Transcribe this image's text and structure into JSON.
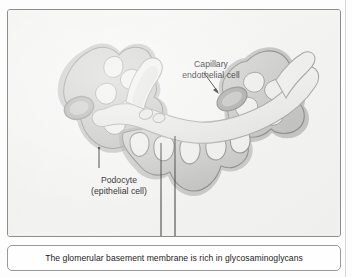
{
  "figure": {
    "panel_background": "#f4f4f3",
    "panel_border_color": "#8d8d8d",
    "labels": [
      {
        "id": "capillary",
        "text": "Capillary\nendothelial cell",
        "leader": "arrow pointing down-right to endothelial nucleus"
      },
      {
        "id": "podocyte",
        "text": "Podocyte\n(epithelial cell)",
        "leader": "line pointing up-right to podocyte cell body"
      }
    ],
    "structures": [
      {
        "name": "podocyte-left",
        "description": "Lobed epithelial cell with foot processes and oval nucleus"
      },
      {
        "name": "podocyte-right",
        "description": "Lobed epithelial cell with foot processes"
      },
      {
        "name": "podocyte-center",
        "description": "Epithelial cell body beneath the basement membrane"
      },
      {
        "name": "capillary-endothelial-cell",
        "description": "Pale curved band forming the capillary wall"
      },
      {
        "name": "endothelial-nucleus",
        "description": "Tilted oval nucleus within the endothelial cell"
      },
      {
        "name": "basement-membrane",
        "description": "Mid-gray band separating endothelium from podocyte foot processes"
      },
      {
        "name": "foot-processes",
        "description": "Interdigitating pedicels along the basement membrane"
      }
    ],
    "colors": {
      "cell_fill": "#c9c9c8",
      "cell_mid": "#b4b4b3",
      "cell_outline": "#8f8f8e",
      "membrane_light": "#e8e8e6",
      "nucleus_fill": "#b9b9b8",
      "nucleus_ring": "#8d8d8c",
      "leader_line": "#303030"
    }
  },
  "caption": {
    "text": "The glomerular basement membrane is rich in glycosaminoglycans",
    "border_color": "#9a9a9a"
  }
}
